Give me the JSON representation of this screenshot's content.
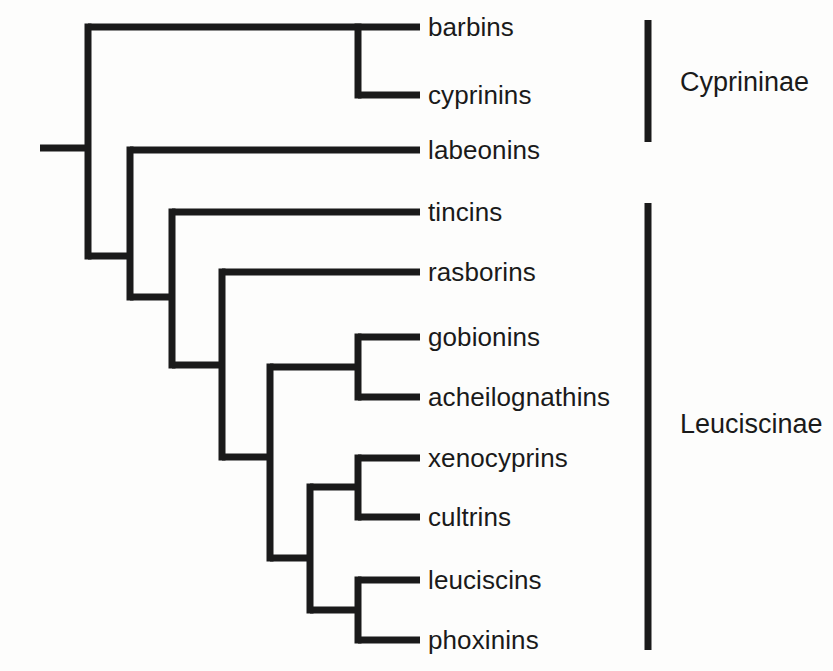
{
  "diagram": {
    "type": "cladogram",
    "title": "",
    "line_color": "#1a1a1a",
    "background_color": "#fdfdfc",
    "text_color": "#1a1a1a"
  },
  "tips": [
    {
      "id": "barbins",
      "label": "barbins",
      "y": 27,
      "label_x": 428,
      "branch_start_x": 358
    },
    {
      "id": "cyprinins",
      "label": "cyprinins",
      "y": 95,
      "label_x": 428,
      "branch_start_x": 358
    },
    {
      "id": "labeonins",
      "label": "labeonins",
      "y": 150,
      "label_x": 428,
      "branch_start_x": 130
    },
    {
      "id": "tincins",
      "label": "tincins",
      "y": 212,
      "label_x": 428,
      "branch_start_x": 172
    },
    {
      "id": "rasborins",
      "label": "rasborins",
      "y": 272,
      "label_x": 428,
      "branch_start_x": 222
    },
    {
      "id": "gobionins",
      "label": "gobionins",
      "y": 337,
      "label_x": 428,
      "branch_start_x": 358
    },
    {
      "id": "acheilognathins",
      "label": "acheilognathins",
      "y": 397,
      "label_x": 428,
      "branch_start_x": 358
    },
    {
      "id": "xenocyprins",
      "label": "xenocyprins",
      "y": 458,
      "label_x": 428,
      "branch_start_x": 358
    },
    {
      "id": "cultrins",
      "label": "cultrins",
      "y": 517,
      "label_x": 428,
      "branch_start_x": 358
    },
    {
      "id": "leuciscins",
      "label": "leuciscins",
      "y": 580,
      "label_x": 428,
      "branch_start_x": 358
    },
    {
      "id": "phoxinins",
      "label": "phoxinins",
      "y": 640,
      "label_x": 428,
      "branch_start_x": 358
    }
  ],
  "tip_line_end_x": 420,
  "root": {
    "x_start": 40,
    "x_end": 88,
    "y": 148
  },
  "nodes": [
    {
      "id": "node-root",
      "x": 88,
      "y_top": 27,
      "y_bottom": 256,
      "children": [
        "node-barbins-cyprinins",
        "node-labeonins-rest"
      ]
    },
    {
      "id": "node-labeonins-rest",
      "x": 130,
      "y_top": 150,
      "y_bottom": 297,
      "children": [
        "labeonins",
        "node-tincins-rest"
      ]
    },
    {
      "id": "node-tincins-rest",
      "x": 172,
      "y_top": 212,
      "y_bottom": 365,
      "children": [
        "tincins",
        "node-rasborins-rest"
      ]
    },
    {
      "id": "node-rasborins-rest",
      "x": 222,
      "y_top": 272,
      "y_bottom": 457,
      "children": [
        "rasborins",
        "node-crown"
      ]
    },
    {
      "id": "node-crown",
      "x": 270,
      "y_top": 367,
      "y_bottom": 558,
      "children": [
        "node-gobionins-acheilognathins",
        "node-lower-crown"
      ]
    },
    {
      "id": "node-barbins-cyprinins",
      "x": 358,
      "y_top": 27,
      "y_bottom": 95,
      "children": [
        "barbins",
        "cyprinins"
      ]
    },
    {
      "id": "node-gobionins-acheilognathins",
      "x": 358,
      "y_top": 337,
      "y_bottom": 397,
      "children": [
        "gobionins",
        "acheilognathins"
      ]
    },
    {
      "id": "node-lower-crown",
      "x": 310,
      "y_top": 487,
      "y_bottom": 610,
      "children": [
        "node-xenocyprins-cultrins",
        "node-leuciscins-phoxinins"
      ]
    },
    {
      "id": "node-xenocyprins-cultrins",
      "x": 358,
      "y_top": 458,
      "y_bottom": 517,
      "children": [
        "xenocyprins",
        "cultrins"
      ]
    },
    {
      "id": "node-leuciscins-phoxinins",
      "x": 358,
      "y_top": 580,
      "y_bottom": 640,
      "children": [
        "leuciscins",
        "phoxinins"
      ]
    }
  ],
  "connectors": [
    {
      "id": "conn-node-barbins-cyprinins",
      "x1": 88,
      "x2": 358,
      "y": 27
    },
    {
      "id": "conn-labeonins",
      "x1": 130,
      "x2": 420,
      "y": 150
    },
    {
      "id": "conn-node-labeonins-rest",
      "x1": 88,
      "x2": 130,
      "y": 256
    },
    {
      "id": "conn-tincins",
      "x1": 172,
      "x2": 420,
      "y": 212
    },
    {
      "id": "conn-node-tincins-rest",
      "x1": 130,
      "x2": 172,
      "y": 297
    },
    {
      "id": "conn-rasborins",
      "x1": 222,
      "x2": 420,
      "y": 272
    },
    {
      "id": "conn-node-rasborins-rest",
      "x1": 172,
      "x2": 222,
      "y": 365
    },
    {
      "id": "conn-node-crown",
      "x1": 222,
      "x2": 270,
      "y": 457
    },
    {
      "id": "conn-gobionins-clade",
      "x1": 270,
      "x2": 358,
      "y": 367
    },
    {
      "id": "conn-lower-crown",
      "x1": 270,
      "x2": 310,
      "y": 558
    },
    {
      "id": "conn-xenocyprins-clade",
      "x1": 310,
      "x2": 358,
      "y": 487
    },
    {
      "id": "conn-leuciscins-clade",
      "x1": 310,
      "x2": 358,
      "y": 610
    },
    {
      "id": "conn-barbins",
      "x1": 358,
      "x2": 420,
      "y": 27
    },
    {
      "id": "conn-cyprinins",
      "x1": 358,
      "x2": 420,
      "y": 95
    },
    {
      "id": "conn-gobionins",
      "x1": 358,
      "x2": 420,
      "y": 337
    },
    {
      "id": "conn-acheilognathins",
      "x1": 358,
      "x2": 420,
      "y": 397
    },
    {
      "id": "conn-xenocyprins",
      "x1": 358,
      "x2": 420,
      "y": 458
    },
    {
      "id": "conn-cultrins",
      "x1": 358,
      "x2": 420,
      "y": 517
    },
    {
      "id": "conn-leuciscins",
      "x1": 358,
      "x2": 420,
      "y": 580
    },
    {
      "id": "conn-phoxinins",
      "x1": 358,
      "x2": 420,
      "y": 640
    }
  ],
  "groups": [
    {
      "id": "cyprininae",
      "label": "Cyprininae",
      "bracket_x": 648,
      "bracket_y_top": 20,
      "bracket_y_bottom": 142,
      "label_x": 680,
      "label_y": 83,
      "members": [
        "barbins",
        "cyprinins",
        "labeonins"
      ]
    },
    {
      "id": "leuciscinae",
      "label": "Leuciscinae",
      "bracket_x": 648,
      "bracket_y_top": 203,
      "bracket_y_bottom": 650,
      "label_x": 680,
      "label_y": 425,
      "members": [
        "tincins",
        "rasborins",
        "gobionins",
        "acheilognathins",
        "xenocyprins",
        "cultrins",
        "leuciscins",
        "phoxinins"
      ]
    }
  ],
  "style": {
    "stroke_width": 7,
    "bracket_width": 7
  }
}
